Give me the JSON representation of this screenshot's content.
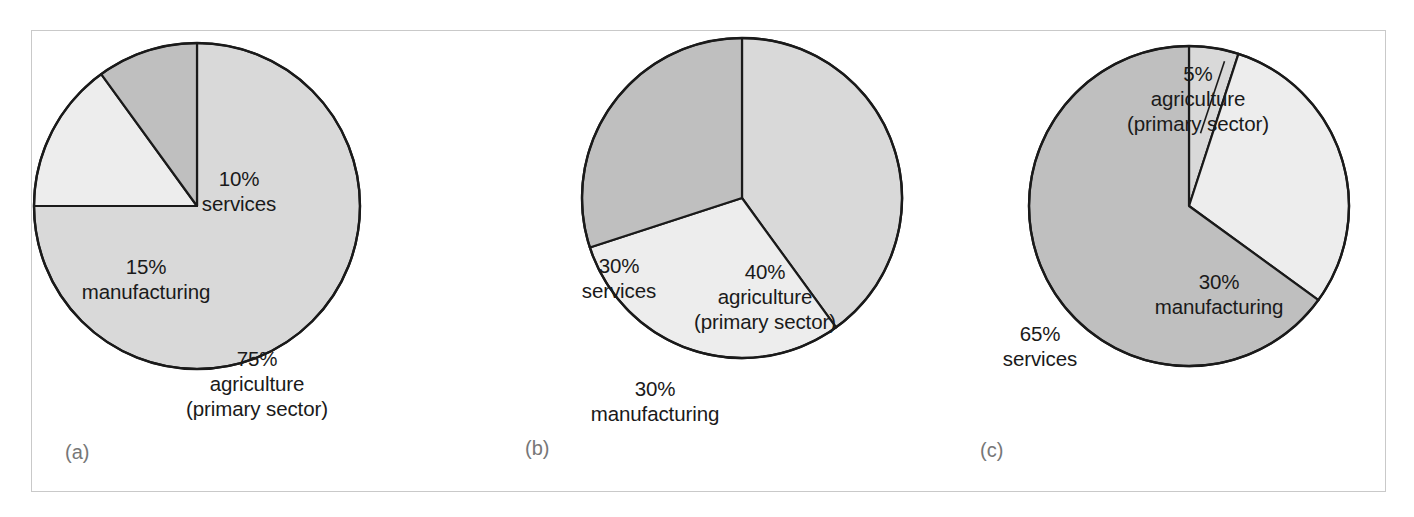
{
  "figure": {
    "background_color": "#ffffff",
    "frame_color": "#c9c9c9",
    "outline_color": "#1a1a1a",
    "label_color": "#1a1a1a",
    "panel_letter_color": "#777777"
  },
  "palette": {
    "agriculture": "#d9d9d9",
    "manufacturing": "#ededed",
    "services": "#bfbfbf"
  },
  "panels": {
    "a": {
      "letter": "(a)",
      "labels": {
        "services": "10%\nservices",
        "manufacturing": "15%\nmanufacturing",
        "agriculture": "75%\nagriculture\n(primary sector)"
      }
    },
    "b": {
      "letter": "(b)",
      "labels": {
        "services": "30%\nservices",
        "agriculture": "40%\nagriculture\n(primary sector)",
        "manufacturing": "30%\nmanufacturing"
      }
    },
    "c": {
      "letter": "(c)",
      "labels": {
        "agriculture": "5%\nagriculture\n(primary sector)",
        "manufacturing": "30%\nmanufacturing",
        "services": "65%\nservices"
      }
    }
  },
  "chart_data": [
    {
      "type": "pie",
      "id": "a",
      "title": "(a)",
      "categories": [
        "agriculture (primary sector)",
        "manufacturing",
        "services"
      ],
      "values": [
        75,
        15,
        10
      ],
      "value_labels": [
        "75%",
        "15%",
        "10%"
      ],
      "colors": [
        "#d9d9d9",
        "#ededed",
        "#bfbfbf"
      ],
      "start_angle_deg": 0,
      "direction": "clockwise",
      "legend": "none",
      "annotations": [
        "75% agriculture (primary sector)",
        "15% manufacturing",
        "10% services"
      ]
    },
    {
      "type": "pie",
      "id": "b",
      "title": "(b)",
      "categories": [
        "agriculture (primary sector)",
        "manufacturing",
        "services"
      ],
      "values": [
        40,
        30,
        30
      ],
      "value_labels": [
        "40%",
        "30%",
        "30%"
      ],
      "colors": [
        "#d9d9d9",
        "#ededed",
        "#bfbfbf"
      ],
      "start_angle_deg": 0,
      "direction": "clockwise",
      "legend": "none",
      "annotations": [
        "40% agriculture (primary sector)",
        "30% manufacturing",
        "30% services"
      ]
    },
    {
      "type": "pie",
      "id": "c",
      "title": "(c)",
      "categories": [
        "agriculture (primary sector)",
        "manufacturing",
        "services"
      ],
      "values": [
        5,
        30,
        65
      ],
      "value_labels": [
        "5%",
        "30%",
        "65%"
      ],
      "colors": [
        "#d9d9d9",
        "#ededed",
        "#bfbfbf"
      ],
      "start_angle_deg": 0,
      "direction": "clockwise",
      "legend": "none",
      "annotations": [
        "5% agriculture (primary sector)",
        "30% manufacturing",
        "65% services"
      ]
    }
  ]
}
